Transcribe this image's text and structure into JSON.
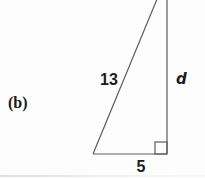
{
  "figure": {
    "part_label": "(b)",
    "shape": "right-triangle",
    "side_labels": {
      "hypotenuse": "13",
      "vertical_leg": "d",
      "base": "5"
    },
    "right_angle_marker": true,
    "colors": {
      "line": "#5c5c5c",
      "text": "#1b1b1b",
      "background": "#fdfdfd"
    }
  }
}
